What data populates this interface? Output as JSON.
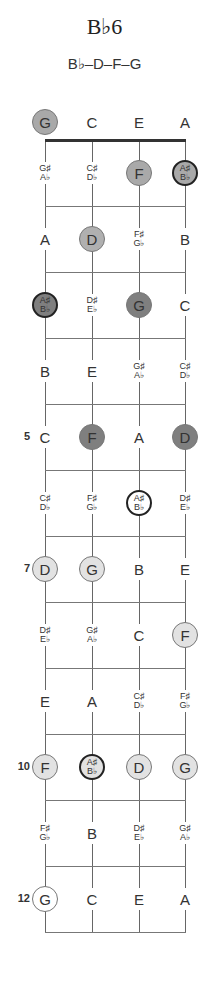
{
  "chord": {
    "title": "B♭6",
    "notes_formula": "B♭–D–F–G"
  },
  "colors": {
    "string": "#666666",
    "fret": "#777777",
    "nut": "#333333",
    "fill_fret1": "#a9a9a9",
    "fill_fret2": "#b0b0b0",
    "fill_dark": "#7f7f7f",
    "fill_light": "#e2e2e2",
    "fill_white": "#ffffff",
    "root_border": "#222222"
  },
  "layout": {
    "strings_x": [
      45,
      92,
      139,
      185
    ],
    "open_row_y": 122,
    "nut_y": 140,
    "fret_spacing": 66,
    "num_frets": 12
  },
  "fret_markers": [
    {
      "fret": 5,
      "label": "5"
    },
    {
      "fret": 7,
      "label": "7"
    },
    {
      "fret": 10,
      "label": "10"
    },
    {
      "fret": 12,
      "label": "12"
    }
  ],
  "fretboard": [
    {
      "fret": 0,
      "notes": [
        {
          "sharp": "G",
          "flat": null,
          "in_chord": true,
          "root": false,
          "fill": "#a9a9a9"
        },
        {
          "sharp": "C",
          "flat": null,
          "in_chord": false
        },
        {
          "sharp": "E",
          "flat": null,
          "in_chord": false
        },
        {
          "sharp": "A",
          "flat": null,
          "in_chord": false
        }
      ]
    },
    {
      "fret": 1,
      "notes": [
        {
          "sharp": "G♯",
          "flat": "A♭",
          "in_chord": false
        },
        {
          "sharp": "C♯",
          "flat": "D♭",
          "in_chord": false
        },
        {
          "sharp": "F",
          "flat": null,
          "in_chord": true,
          "root": false,
          "fill": "#a9a9a9"
        },
        {
          "sharp": "A♯",
          "flat": "B♭",
          "in_chord": true,
          "root": true,
          "fill": "#a9a9a9"
        }
      ]
    },
    {
      "fret": 2,
      "notes": [
        {
          "sharp": "A",
          "flat": null,
          "in_chord": false
        },
        {
          "sharp": "D",
          "flat": null,
          "in_chord": true,
          "root": false,
          "fill": "#b0b0b0"
        },
        {
          "sharp": "F♯",
          "flat": "G♭",
          "in_chord": false
        },
        {
          "sharp": "B",
          "flat": null,
          "in_chord": false
        }
      ]
    },
    {
      "fret": 3,
      "notes": [
        {
          "sharp": "A♯",
          "flat": "B♭",
          "in_chord": true,
          "root": true,
          "fill": "#7f7f7f"
        },
        {
          "sharp": "D♯",
          "flat": "E♭",
          "in_chord": false
        },
        {
          "sharp": "G",
          "flat": null,
          "in_chord": true,
          "root": false,
          "fill": "#7f7f7f"
        },
        {
          "sharp": "C",
          "flat": null,
          "in_chord": false
        }
      ]
    },
    {
      "fret": 4,
      "notes": [
        {
          "sharp": "B",
          "flat": null,
          "in_chord": false
        },
        {
          "sharp": "E",
          "flat": null,
          "in_chord": false
        },
        {
          "sharp": "G♯",
          "flat": "A♭",
          "in_chord": false
        },
        {
          "sharp": "C♯",
          "flat": "D♭",
          "in_chord": false
        }
      ]
    },
    {
      "fret": 5,
      "notes": [
        {
          "sharp": "C",
          "flat": null,
          "in_chord": false
        },
        {
          "sharp": "F",
          "flat": null,
          "in_chord": true,
          "root": false,
          "fill": "#7f7f7f"
        },
        {
          "sharp": "A",
          "flat": null,
          "in_chord": false
        },
        {
          "sharp": "D",
          "flat": null,
          "in_chord": true,
          "root": false,
          "fill": "#7f7f7f"
        }
      ]
    },
    {
      "fret": 6,
      "notes": [
        {
          "sharp": "C♯",
          "flat": "D♭",
          "in_chord": false
        },
        {
          "sharp": "F♯",
          "flat": "G♭",
          "in_chord": false
        },
        {
          "sharp": "A♯",
          "flat": "B♭",
          "in_chord": true,
          "root": true,
          "fill": "#ffffff"
        },
        {
          "sharp": "D♯",
          "flat": "E♭",
          "in_chord": false
        }
      ]
    },
    {
      "fret": 7,
      "notes": [
        {
          "sharp": "D",
          "flat": null,
          "in_chord": true,
          "root": false,
          "fill": "#e2e2e2"
        },
        {
          "sharp": "G",
          "flat": null,
          "in_chord": true,
          "root": false,
          "fill": "#e2e2e2"
        },
        {
          "sharp": "B",
          "flat": null,
          "in_chord": false
        },
        {
          "sharp": "E",
          "flat": null,
          "in_chord": false
        }
      ]
    },
    {
      "fret": 8,
      "notes": [
        {
          "sharp": "D♯",
          "flat": "E♭",
          "in_chord": false
        },
        {
          "sharp": "G♯",
          "flat": "A♭",
          "in_chord": false
        },
        {
          "sharp": "C",
          "flat": null,
          "in_chord": false
        },
        {
          "sharp": "F",
          "flat": null,
          "in_chord": true,
          "root": false,
          "fill": "#e2e2e2"
        }
      ]
    },
    {
      "fret": 9,
      "notes": [
        {
          "sharp": "E",
          "flat": null,
          "in_chord": false
        },
        {
          "sharp": "A",
          "flat": null,
          "in_chord": false
        },
        {
          "sharp": "C♯",
          "flat": "D♭",
          "in_chord": false
        },
        {
          "sharp": "F♯",
          "flat": "G♭",
          "in_chord": false
        }
      ]
    },
    {
      "fret": 10,
      "notes": [
        {
          "sharp": "F",
          "flat": null,
          "in_chord": true,
          "root": false,
          "fill": "#e2e2e2"
        },
        {
          "sharp": "A♯",
          "flat": "B♭",
          "in_chord": true,
          "root": true,
          "fill": "#e2e2e2"
        },
        {
          "sharp": "D",
          "flat": null,
          "in_chord": true,
          "root": false,
          "fill": "#e2e2e2"
        },
        {
          "sharp": "G",
          "flat": null,
          "in_chord": true,
          "root": false,
          "fill": "#e2e2e2"
        }
      ]
    },
    {
      "fret": 11,
      "notes": [
        {
          "sharp": "F♯",
          "flat": "G♭",
          "in_chord": false
        },
        {
          "sharp": "B",
          "flat": null,
          "in_chord": false
        },
        {
          "sharp": "D♯",
          "flat": "E♭",
          "in_chord": false
        },
        {
          "sharp": "G♯",
          "flat": "A♭",
          "in_chord": false
        }
      ]
    },
    {
      "fret": 12,
      "notes": [
        {
          "sharp": "G",
          "flat": null,
          "in_chord": true,
          "root": false,
          "fill": "#ffffff"
        },
        {
          "sharp": "C",
          "flat": null,
          "in_chord": false
        },
        {
          "sharp": "E",
          "flat": null,
          "in_chord": false
        },
        {
          "sharp": "A",
          "flat": null,
          "in_chord": false
        }
      ]
    }
  ]
}
